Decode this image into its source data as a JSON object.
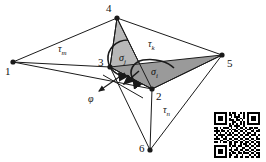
{
  "figure": {
    "width": 266,
    "height": 162,
    "background_color": "#ffffff",
    "line_color": "#1a1a1a",
    "fill_light_gray": "#b8b8b8",
    "fill_dark_gray": "#9a9a9a"
  },
  "nodes": [
    {
      "id": "1",
      "label": "1",
      "x": 13,
      "y": 62,
      "label_x": 5,
      "label_y": 66
    },
    {
      "id": "2",
      "label": "2",
      "x": 152,
      "y": 89,
      "label_x": 156,
      "label_y": 91
    },
    {
      "id": "3",
      "label": "3",
      "x": 110,
      "y": 67,
      "label_x": 98,
      "label_y": 57
    },
    {
      "id": "4",
      "label": "4",
      "x": 117,
      "y": 18,
      "label_x": 106,
      "label_y": 3
    },
    {
      "id": "5",
      "label": "5",
      "x": 222,
      "y": 55,
      "label_x": 227,
      "label_y": 58
    },
    {
      "id": "6",
      "label": "6",
      "x": 150,
      "y": 150,
      "label_x": 139,
      "label_y": 143
    }
  ],
  "edges": [
    {
      "from": "1",
      "to": "4"
    },
    {
      "from": "1",
      "to": "3"
    },
    {
      "from": "1",
      "to": "2"
    },
    {
      "from": "4",
      "to": "3"
    },
    {
      "from": "4",
      "to": "2"
    },
    {
      "from": "4",
      "to": "5"
    },
    {
      "from": "3",
      "to": "2"
    },
    {
      "from": "3",
      "to": "6"
    },
    {
      "from": "2",
      "to": "5"
    },
    {
      "from": "2",
      "to": "6"
    },
    {
      "from": "5",
      "to": "6"
    }
  ],
  "faces": [
    {
      "name": "face-4-3-2",
      "nodes": [
        "4",
        "3",
        "2"
      ],
      "shade": "light"
    },
    {
      "name": "face-3-2-5",
      "nodes": [
        "3",
        "2",
        "5"
      ],
      "shade": "dark"
    }
  ],
  "edge_labels": [
    {
      "name": "tau-m",
      "symbol": "τ",
      "subscript": "m",
      "x": 58,
      "y": 44
    },
    {
      "name": "tau-k",
      "symbol": "τ",
      "subscript": "k",
      "x": 148,
      "y": 39
    },
    {
      "name": "tau-n",
      "symbol": "τ",
      "subscript": "n",
      "x": 163,
      "y": 105
    }
  ],
  "rotation_labels": [
    {
      "name": "sigma-j",
      "symbol": "σ",
      "subscript": "j",
      "x": 119,
      "y": 53
    },
    {
      "name": "sigma-i",
      "symbol": "σ",
      "subscript": "i",
      "x": 151,
      "y": 67
    }
  ],
  "vector_labels": [
    {
      "name": "phi",
      "symbol": "φ",
      "x": 88,
      "y": 94
    }
  ],
  "arrows": {
    "phi_arrow": {
      "x1": 125,
      "y1": 73,
      "x2": 99,
      "y2": 91
    },
    "normal_arrow": {
      "x1": 139,
      "y1": 71,
      "x2": 124,
      "y2": 84
    },
    "cross_line": {
      "x1": 103,
      "y1": 75,
      "x2": 143,
      "y2": 98
    }
  },
  "qr_code": {
    "name": "qr-code",
    "x": 214,
    "y": 112,
    "size": 46,
    "modules": 25,
    "bits": [
      "1111111010110010101111111",
      "1000001011010100101000001",
      "1011101001011100101011101",
      "1011101010001010101011101",
      "1011101011101101001011101",
      "1000001000110010101000001",
      "1111111010101010101111111",
      "0000000011011100100000000",
      "1101011101001011010110110",
      "0100100010110100101101001",
      "1110110101011011010011011",
      "0101001010100100101100100",
      "1011110111011011011011101",
      "0100101000100100100100010",
      "1110011011011011011011011",
      "0001100100100100100100100",
      "1101011011011011011011011",
      "0000000011010010110100101",
      "1111111010110110011011011",
      "1000001001001001100100100",
      "1011101011011011011011011",
      "1011101001100100100100100",
      "1011101010110110111011011",
      "1000001011001001000100101",
      "1111111010011011011011011"
    ]
  }
}
